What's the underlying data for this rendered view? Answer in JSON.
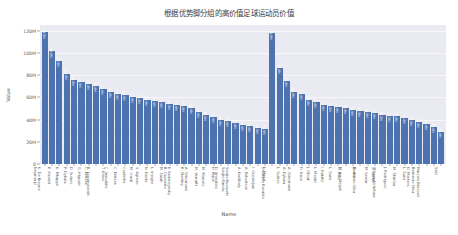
{
  "chart_data": {
    "type": "bar",
    "title": "根据优势脚分组的高价值足球运动员价值",
    "xlabel": "Name",
    "ylabel": "Value",
    "ylim": [
      0,
      125000000
    ],
    "ytick_labels": [
      "0",
      "20M",
      "40M",
      "60M",
      "80M",
      "100M",
      "120M"
    ],
    "ytick_values": [
      0,
      20000000,
      40000000,
      60000000,
      80000000,
      100000000,
      120000000
    ],
    "grid": true,
    "legend": null,
    "bar_color": "#4c72b0",
    "categories": [
      "Neymar Jr",
      "K. De Bruyne",
      "E. Hazard",
      "K. Mbappé",
      "P. Dybala",
      "D. Suárez",
      "G. Higuaín",
      "C. Eriksen",
      "R. Lewandowski",
      "T. Kroos",
      "C. Immobile",
      "C. Eriksen",
      "Coutinho",
      "M. Icardi",
      "S. Agüero",
      "N. Kanté",
      "L. Insigne",
      "M. Salah",
      "B. Casemiro",
      "E. Kudanzynsky",
      "R. Sterling",
      "A. Griezmann",
      "M. Verratti",
      "M. Marcelo",
      "H. Piqué",
      "D. Immobile",
      "Sergio Ramos",
      "Sergio Busquets",
      "A. Koulibaly",
      "A. Robertson",
      "I. Gündoğan",
      "L. Messi",
      "Cristiano Ronaldo",
      "L. Suárez",
      "A. Dybala",
      "A. Griezmann",
      "H. Kane",
      "J. Oblak",
      "L. Modrić",
      "I. Rakitić",
      "L. Sané",
      "G. Bale",
      "M. ter Stegen",
      "D. Alli",
      "Bernardo Silva",
      "M. Lemar",
      "S. Umtiti",
      "Thiago Alcântara",
      "J. Rodríguez",
      "M. Škriniar",
      "L. Sané",
      "D. Mertens",
      "Bernardo Silva",
      "Marcelo Brozović",
      "Saúl"
    ],
    "values": [
      118500000,
      102000000,
      93000000,
      81000000,
      76000000,
      73500000,
      72000000,
      70000000,
      67500000,
      65000000,
      63000000,
      62000000,
      60500000,
      59000000,
      57500000,
      56500000,
      55500000,
      54000000,
      53000000,
      52000000,
      50000000,
      47000000,
      44500000,
      42000000,
      40000000,
      38500000,
      37000000,
      35500000,
      34000000,
      32500000,
      31500000,
      118000000,
      86000000,
      75000000,
      65000000,
      63000000,
      58000000,
      56000000,
      53500000,
      52000000,
      51000000,
      50000000,
      48500000,
      47500000,
      46500000,
      45500000,
      44500000,
      43500000,
      43000000,
      41000000,
      39500000,
      38000000,
      36000000,
      33000000,
      29000000
    ],
    "bar_value_labels": [
      "118.5M",
      "102.0M",
      "93.0M",
      "81.0M",
      "76.0M",
      "73.5M",
      "72.0M",
      "70.0M",
      "67.5M",
      "65.0M",
      "63.0M",
      "62.0M",
      "60.5M",
      "59.0M",
      "57.5M",
      "56.5M",
      "55.5M",
      "54.0M",
      "53.0M",
      "52.0M",
      "50.0M",
      "47.0M",
      "44.5M",
      "42.0M",
      "40.0M",
      "38.5M",
      "37.0M",
      "35.5M",
      "34.0M",
      "32.5M",
      "31.5M",
      "118.0M",
      "86.0M",
      "75.0M",
      "65.0M",
      "63.0M",
      "58.0M",
      "56.0M",
      "53.5M",
      "52.0M",
      "51.0M",
      "50.0M",
      "48.5M",
      "47.5M",
      "46.5M",
      "45.5M",
      "44.5M",
      "43.5M",
      "43.0M",
      "41.0M",
      "39.5M",
      "38.0M",
      "36.0M",
      "33.0M",
      "29.0M"
    ]
  }
}
